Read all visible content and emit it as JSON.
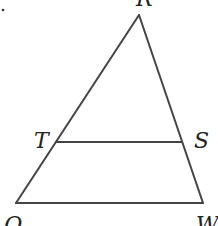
{
  "diagram": {
    "type": "triangle-with-midsegment",
    "stroke_color": "#444444",
    "label_color": "#222222",
    "points": {
      "R": {
        "label": "R",
        "x": 139,
        "y": 15,
        "lx": 136,
        "ly": 6
      },
      "Q": {
        "label": "Q",
        "x": 16,
        "y": 203,
        "lx": 4,
        "ly": 232
      },
      "W": {
        "label": "W",
        "x": 203,
        "y": 203,
        "lx": 196,
        "ly": 232
      },
      "T": {
        "label": "T",
        "x": 56,
        "y": 142,
        "lx": 34,
        "ly": 148
      },
      "S": {
        "label": "S",
        "x": 181,
        "y": 142,
        "lx": 194,
        "ly": 148
      }
    },
    "segments": [
      [
        "R",
        "Q"
      ],
      [
        "R",
        "W"
      ],
      [
        "Q",
        "W"
      ],
      [
        "T",
        "S"
      ]
    ],
    "corner_mark": "."
  }
}
